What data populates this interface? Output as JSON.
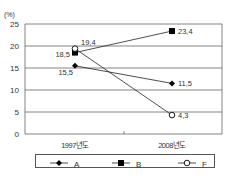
{
  "page": {
    "cut_off_text": "……………………………………"
  },
  "chart_data": {
    "type": "line",
    "title": "",
    "xlabel": "",
    "ylabel": "(%)",
    "categories": [
      "1997년도",
      "2008년도"
    ],
    "ylim": [
      0,
      25
    ],
    "yticks": [
      0,
      5,
      10,
      15,
      20,
      25
    ],
    "grid": true,
    "legend_position": "bottom",
    "series": [
      {
        "name": "A",
        "marker": "diamond-filled",
        "values": [
          15.5,
          11.5
        ],
        "labels": [
          "15,5",
          "11,5"
        ]
      },
      {
        "name": "B",
        "marker": "square-filled",
        "values": [
          18.5,
          23.4
        ],
        "labels": [
          "18,5",
          "23,4"
        ]
      },
      {
        "name": "F",
        "marker": "circle-open",
        "values": [
          19.4,
          4.3
        ],
        "labels": [
          "19,4",
          "4,3"
        ]
      }
    ]
  }
}
